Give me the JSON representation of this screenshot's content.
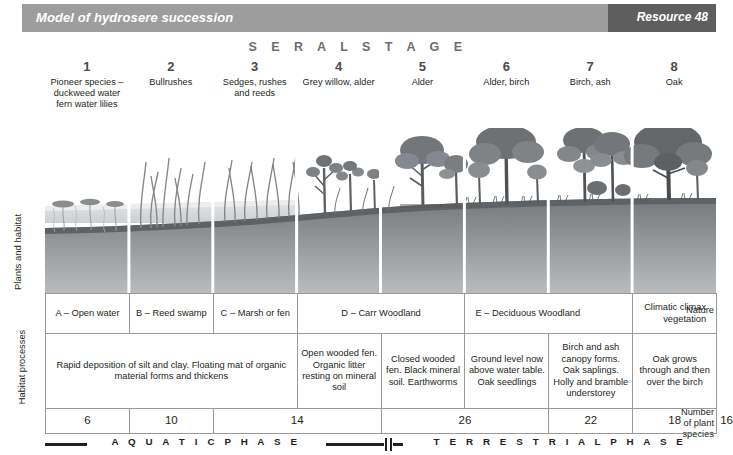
{
  "header": {
    "title": "Model of hydrosere succession",
    "badge": "Resource 48"
  },
  "seral_stage_title": "S E R A L   S T A G E",
  "stages": [
    {
      "number": "1",
      "label": "Pioneer species – duckweed water fern water lilies"
    },
    {
      "number": "2",
      "label": "Bullrushes"
    },
    {
      "number": "3",
      "label": "Sedges, rushes and reeds"
    },
    {
      "number": "4",
      "label": "Grey willow, alder"
    },
    {
      "number": "5",
      "label": "Alder"
    },
    {
      "number": "6",
      "label": "Alder, birch"
    },
    {
      "number": "7",
      "label": "Birch, ash"
    },
    {
      "number": "8",
      "label": "Oak"
    }
  ],
  "side_labels": {
    "plants_and_habitat": "Plants and habitat",
    "nature": "Nature",
    "habitat_processes": "Habitat processes",
    "number_of_plant_species": "Number of plant species"
  },
  "nature_row": [
    {
      "text": "A – Open water",
      "span": 1,
      "align": "center"
    },
    {
      "text": "B – Reed swamp",
      "span": 1,
      "align": "center"
    },
    {
      "text": "C – Marsh or fen",
      "span": 1,
      "align": "center"
    },
    {
      "text": "D – Carr Woodland",
      "span": 2,
      "align": "center"
    },
    {
      "text": "E – Deciduous Woodland",
      "span": 2,
      "align": "left"
    },
    {
      "text": "Climatic climax vegetation",
      "span": 1,
      "align": "right"
    }
  ],
  "processes_row": [
    {
      "text": "Rapid deposition of silt and clay. Floating mat of organic material forms and thickens",
      "span": 3
    },
    {
      "text": "Open wooded fen. Organic litter resting on mineral soil",
      "span": 1
    },
    {
      "text": "Closed wooded fen. Black mineral soil. Earthworms",
      "span": 1
    },
    {
      "text": "Ground level now above water table. Oak seedlings",
      "span": 1
    },
    {
      "text": "Birch and ash canopy forms. Oak saplings. Holly and bramble understorey",
      "span": 1
    },
    {
      "text": "Oak grows through and then over the birch",
      "span": 1
    }
  ],
  "species_row": [
    {
      "value": "6",
      "span": 1
    },
    {
      "value": "10",
      "span": 1
    },
    {
      "value": "14",
      "span": 2
    },
    {
      "value": "26",
      "span": 2
    },
    {
      "value": "22",
      "span": 1
    },
    {
      "value": "18",
      "span": 1
    },
    {
      "value": "16",
      "span": 1
    }
  ],
  "phases": {
    "aquatic": "A Q U A T I C   P H A S E",
    "terrestrial": "T E R R E S T R I A L   P H A S E"
  },
  "colors": {
    "header_bar": "#9d9d9d",
    "header_badge": "#5e5e5e",
    "title_text": "#ffffff",
    "seral_title": "#6d6d6d",
    "body_text": "#231f20",
    "table_border": "#9a9a9a",
    "water": "#d9dadb",
    "soil_dark": "#6f7173",
    "soil_light": "#a8abad",
    "vegetation_dark": "#6b6e70",
    "vegetation_light": "#9a9d9f"
  }
}
